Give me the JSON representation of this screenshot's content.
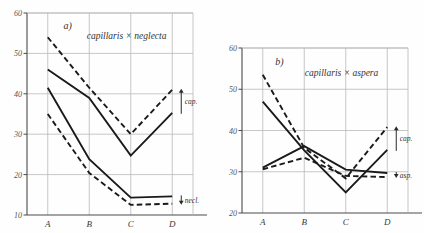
{
  "figure": {
    "background_color": "#fefefe",
    "line_color": "#1a1a1a",
    "grid_color": "#b9b9b9",
    "axis_color": "#4a4a4a"
  },
  "chart_data": [
    {
      "type": "line",
      "panel_id": "a",
      "panel_letter": "a)",
      "title": "capillaris × neglecta",
      "xlabel": "",
      "ylabel": "",
      "categories": [
        "A",
        "B",
        "C",
        "D"
      ],
      "x": [
        1,
        2,
        3,
        4
      ],
      "xlim": [
        0.55,
        4.45
      ],
      "ylim": [
        10,
        60
      ],
      "yticks": [
        10,
        20,
        30,
        40,
        50,
        60
      ],
      "ytick_labels": [
        "10",
        "20",
        "30",
        "40",
        "50",
        "60"
      ],
      "grid": true,
      "legend": "none",
      "annotations": [
        {
          "text": "cap.",
          "group": "capillaris",
          "at_category": "D",
          "direction": "up"
        },
        {
          "text": "necl.",
          "group": "neglecta",
          "at_category": "D",
          "direction": "down"
        }
      ],
      "series": [
        {
          "name": "capillaris-dashed",
          "style": "dashed",
          "group": "cap.",
          "values": [
            54,
            41.5,
            30,
            41
          ]
        },
        {
          "name": "capillaris-solid",
          "style": "solid",
          "group": "cap.",
          "values": [
            46,
            39,
            24.7,
            35.3
          ]
        },
        {
          "name": "neglecta-solid",
          "style": "solid",
          "group": "necl.",
          "values": [
            41.5,
            23.8,
            14.3,
            14.6
          ]
        },
        {
          "name": "neglecta-dashed",
          "style": "dashed",
          "group": "necl.",
          "values": [
            35,
            20.4,
            12.5,
            12.8
          ]
        }
      ]
    },
    {
      "type": "line",
      "panel_id": "b",
      "panel_letter": "b)",
      "title": "capillaris × aspera",
      "xlabel": "",
      "ylabel": "",
      "categories": [
        "A",
        "B",
        "C",
        "D"
      ],
      "x": [
        1,
        2,
        3,
        4
      ],
      "xlim": [
        0.55,
        4.45
      ],
      "ylim": [
        20,
        60
      ],
      "yticks": [
        20,
        30,
        40,
        50,
        60
      ],
      "ytick_labels": [
        "20",
        "30",
        "40",
        "50",
        "60"
      ],
      "grid": true,
      "legend": "none",
      "annotations": [
        {
          "text": "cap.",
          "group": "capillaris",
          "at_category": "D",
          "direction": "up"
        },
        {
          "text": "asp.",
          "group": "aspera",
          "at_category": "D",
          "direction": "down"
        }
      ],
      "series": [
        {
          "name": "capillaris-dashed",
          "style": "dashed",
          "group": "cap.",
          "values": [
            53.5,
            35.8,
            28.4,
            40.8
          ]
        },
        {
          "name": "capillaris-solid",
          "style": "solid",
          "group": "cap.",
          "values": [
            47,
            35.2,
            25,
            35.3
          ]
        },
        {
          "name": "aspera-solid",
          "style": "solid",
          "group": "asp.",
          "values": [
            31,
            36.2,
            30.5,
            29.7
          ]
        },
        {
          "name": "aspera-dashed",
          "style": "dashed",
          "group": "asp.",
          "values": [
            30.6,
            33.4,
            29,
            28.7
          ]
        }
      ]
    }
  ]
}
